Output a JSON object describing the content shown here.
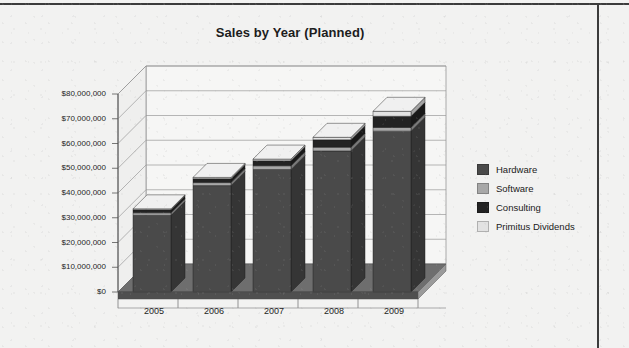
{
  "chart_data": {
    "type": "bar",
    "subtype": "stacked-3d-column",
    "title": "Sales by Year (Planned)",
    "xlabel": "",
    "ylabel": "",
    "categories": [
      "2005",
      "2006",
      "2007",
      "2008",
      "2009"
    ],
    "series": [
      {
        "name": "Hardware",
        "color": "#4a4a4a",
        "values": [
          31000000,
          43000000,
          49500000,
          57000000,
          65000000
        ]
      },
      {
        "name": "Software",
        "color": "#a8a8a8",
        "values": [
          1000000,
          1200000,
          1500000,
          1500000,
          1500000
        ]
      },
      {
        "name": "Consulting",
        "color": "#232323",
        "values": [
          1200000,
          1600000,
          2000000,
          3000000,
          4500000
        ]
      },
      {
        "name": "Primitus Dividends",
        "color": "#e2e2e2",
        "values": [
          400000,
          500000,
          700000,
          1000000,
          2000000
        ]
      }
    ],
    "totals": [
      33600000,
      46300000,
      53700000,
      62500000,
      73000000
    ],
    "ylim": [
      0,
      80000000
    ],
    "ytick_values": [
      0,
      10000000,
      20000000,
      30000000,
      40000000,
      50000000,
      60000000,
      70000000,
      80000000
    ],
    "ytick_labels": [
      "$0",
      "$10,000,000",
      "$20,000,000",
      "$30,000,000",
      "$40,000,000",
      "$50,000,000",
      "$60,000,000",
      "$70,000,000",
      "$80,000,000"
    ],
    "grid": true,
    "legend_position": "right"
  },
  "legend": {
    "items": [
      {
        "label": "Hardware",
        "swatch": "#4a4a4a"
      },
      {
        "label": "Software",
        "swatch": "#a8a8a8"
      },
      {
        "label": "Consulting",
        "swatch": "#232323"
      },
      {
        "label": "Primitus Dividends",
        "swatch": "#e2e2e2"
      }
    ]
  },
  "colors": {
    "page_background": "#f2f2f1",
    "border_rule": "#3c3c3c",
    "axis_line": "#8a8a8a",
    "gridline": "#9a9a9a",
    "floor_top": "#6e6e6e",
    "floor_side": "#4f4f4f",
    "wall_back": "#f6f6f5",
    "text": "#1c1c1c"
  }
}
